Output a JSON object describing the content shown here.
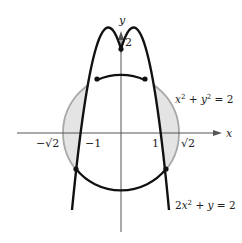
{
  "figure": {
    "type": "region-between-curves",
    "curves": [
      {
        "name": "circle",
        "equation": "x² + y² = 2",
        "label_parts": {
          "a": "x",
          "a_exp": "2",
          "op": " + ",
          "b": "y",
          "b_exp": "2",
          "rhs": " = 2"
        }
      },
      {
        "name": "parabola",
        "equation": "2x² + y = 2",
        "label_parts": {
          "coef": "2",
          "a": "x",
          "a_exp": "2",
          "op": " + ",
          "b": "y",
          "rhs": " = 2"
        }
      }
    ],
    "axes": {
      "x_label": "x",
      "y_label": "y",
      "x_ticks": [
        "−√2",
        "−1",
        "1",
        "√2"
      ],
      "y_ticks": [
        "2"
      ]
    },
    "intersection_points": [
      {
        "x": -0.6,
        "y": 1.28
      },
      {
        "x": 0.6,
        "y": 1.28
      },
      {
        "x": -1.18,
        "y": -0.78
      },
      {
        "x": 1.18,
        "y": -0.78
      },
      {
        "x": 0,
        "y": 2
      }
    ],
    "colors": {
      "curve": "#111111",
      "shade_fill": "#e4e4e4",
      "circle_gray": "#a8a8a8",
      "axis": "#555555"
    }
  }
}
